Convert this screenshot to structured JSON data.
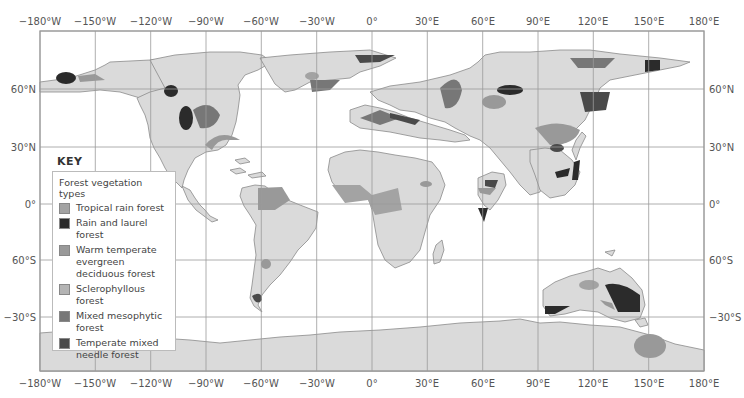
{
  "map": {
    "title": "Forest vegetation types world map",
    "frame": {
      "x": 40,
      "y": 31,
      "width": 664,
      "height": 340
    },
    "colors": {
      "ocean": "#ffffff",
      "land": "#dadada",
      "coastline": "#8a8a8a",
      "grid": "#9a9a9a",
      "tropical_rain_forest": "#a3a3a3",
      "rain_and_laurel_forest": "#2b2b2b",
      "warm_temperate_evergreen_deciduous_forest": "#999999",
      "sclerophyllous_forest": "#b4b4b4",
      "mixed_mesophytic_forest": "#777777",
      "temperate_mixed_needle_forest": "#4a4a4a"
    }
  },
  "axes": {
    "top_labels": [
      "−180°W",
      "−150°W",
      "−120°W",
      "−90°W",
      "−60°W",
      "−30°W",
      "0°",
      "30°E",
      "60°E",
      "90°E",
      "120°E",
      "150°E",
      "180°E"
    ],
    "bottom_labels": [
      "−180°W",
      "−150°W",
      "−120°W",
      "−90°W",
      "−60°W",
      "−30°W",
      "0°",
      "30°E",
      "60°E",
      "90°E",
      "120°E",
      "150°E",
      "180°E"
    ],
    "left_labels": [
      "60°N",
      "30°N",
      "0°",
      "60°S",
      "−30°S"
    ],
    "right_labels": [
      "60°N",
      "30°N",
      "0°",
      "60°S",
      "−30°S"
    ]
  },
  "key": {
    "title": "KEY",
    "heading": "Forest vegetation types",
    "items": [
      {
        "label": "Tropical rain forest",
        "color": "#a3a3a3"
      },
      {
        "label": "Rain and laurel forest",
        "color": "#2b2b2b"
      },
      {
        "label": "Warm temperate evergreen deciduous forest",
        "color": "#999999"
      },
      {
        "label": "Sclerophyllous forest",
        "color": "#b4b4b4"
      },
      {
        "label": "Mixed mesophytic forest",
        "color": "#777777"
      },
      {
        "label": "Temperate mixed needle forest",
        "color": "#4a4a4a"
      }
    ]
  }
}
